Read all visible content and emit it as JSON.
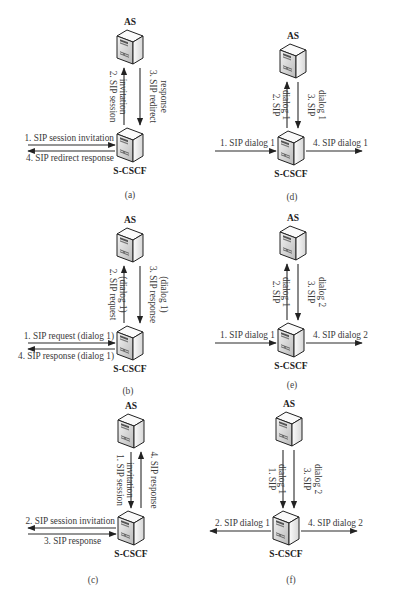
{
  "figure": {
    "nodes": {
      "top": "AS",
      "bottom": "S-CSCF"
    },
    "panels": [
      {
        "id": "a",
        "caption": "(a)",
        "layout": "left-bidir",
        "as": {
          "x": 130,
          "y": 30
        },
        "cscf": {
          "x": 130,
          "y": 128
        },
        "captionPos": {
          "x": 130,
          "y": 198
        },
        "vertical": [
          {
            "num": "2.",
            "lines": [
              "2. SIP session",
              "invitation"
            ],
            "dir": "up",
            "x": 124
          },
          {
            "num": "3.",
            "lines": [
              "3. SIP redirect",
              "response"
            ],
            "dir": "down",
            "x": 140
          }
        ],
        "horizontal": [
          {
            "label": "1. SIP session invitation",
            "dir": "right",
            "side": "left",
            "labelPos": "above"
          },
          {
            "label": "4. SIP redirect response",
            "dir": "left",
            "side": "left",
            "labelPos": "below"
          }
        ]
      },
      {
        "id": "d",
        "caption": "(d)",
        "layout": "through",
        "as": {
          "x": 293,
          "y": 44
        },
        "cscf": {
          "x": 291,
          "y": 131
        },
        "captionPos": {
          "x": 292,
          "y": 200
        },
        "vertical": [
          {
            "lines": [
              "2. SIP",
              "dialog 1"
            ],
            "dir": "up",
            "x": 287
          },
          {
            "lines": [
              "3. SIP",
              "dialog 1"
            ],
            "dir": "down",
            "x": 298
          }
        ],
        "horizontal": [
          {
            "label": "1. SIP dialog 1",
            "dir": "right",
            "side": "left"
          },
          {
            "label": "4. SIP dialog 1",
            "dir": "right",
            "side": "right"
          }
        ]
      },
      {
        "id": "b",
        "caption": "(b)",
        "layout": "left-bidir",
        "as": {
          "x": 130,
          "y": 228
        },
        "cscf": {
          "x": 130,
          "y": 326
        },
        "captionPos": {
          "x": 128,
          "y": 394
        },
        "vertical": [
          {
            "lines": [
              "2. SIP request",
              "(dialog 1)"
            ],
            "dir": "up",
            "x": 124
          },
          {
            "lines": [
              "3. SIP response",
              "(dialog 1)"
            ],
            "dir": "down",
            "x": 140
          }
        ],
        "horizontal": [
          {
            "label": "1. SIP request (dialog 1)",
            "dir": "right",
            "side": "left",
            "labelPos": "above"
          },
          {
            "label": "4. SIP response (dialog 1)",
            "dir": "left",
            "side": "left",
            "labelPos": "below"
          }
        ]
      },
      {
        "id": "e",
        "caption": "(e)",
        "layout": "through",
        "as": {
          "x": 293,
          "y": 226
        },
        "cscf": {
          "x": 291,
          "y": 323
        },
        "captionPos": {
          "x": 292,
          "y": 388
        },
        "vertical": [
          {
            "lines": [
              "2. SIP",
              "dialog 1"
            ],
            "dir": "up",
            "x": 287
          },
          {
            "lines": [
              "3. SIP",
              "dialog 2"
            ],
            "dir": "down",
            "x": 298
          }
        ],
        "horizontal": [
          {
            "label": "1. SIP dialog 1",
            "dir": "right",
            "side": "left"
          },
          {
            "label": "4. SIP dialog 2",
            "dir": "right",
            "side": "right"
          }
        ]
      },
      {
        "id": "c",
        "caption": "(c)",
        "layout": "left-bidir-out",
        "as": {
          "x": 131,
          "y": 414
        },
        "cscf": {
          "x": 131,
          "y": 511
        },
        "captionPos": {
          "x": 93,
          "y": 583
        },
        "vertical": [
          {
            "lines": [
              "1. SIP session",
              "invitation"
            ],
            "dir": "down",
            "x": 131
          },
          {
            "lines": [
              "4. SIP response"
            ],
            "dir": "up",
            "x": 141
          }
        ],
        "horizontal": [
          {
            "label": "2. SIP session invitation",
            "dir": "left",
            "side": "left",
            "labelPos": "above"
          },
          {
            "label": "3. SIP response",
            "dir": "right",
            "side": "left",
            "labelPos": "below"
          }
        ]
      },
      {
        "id": "f",
        "caption": "(f)",
        "layout": "fork",
        "as": {
          "x": 289,
          "y": 412
        },
        "cscf": {
          "x": 286,
          "y": 511
        },
        "captionPos": {
          "x": 291,
          "y": 583
        },
        "vertical": [
          {
            "lines": [
              "1. SIP",
              "dialog 1"
            ],
            "dir": "down",
            "x": 283
          },
          {
            "lines": [
              "3. SIP",
              "dialog 2"
            ],
            "dir": "down",
            "x": 294
          }
        ],
        "horizontal": [
          {
            "label": "2. SIP dialog 1",
            "dir": "left",
            "side": "left"
          },
          {
            "label": "4. SIP dialog 2",
            "dir": "right",
            "side": "right"
          }
        ]
      }
    ]
  }
}
